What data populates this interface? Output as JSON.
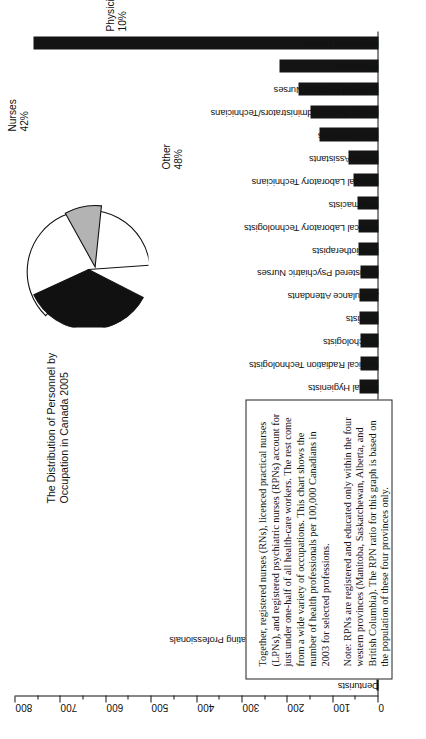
{
  "chart_data": {
    "type": "bar",
    "orientation": "vertical",
    "title": "",
    "xlabel": "",
    "ylabel": "",
    "ylim": [
      0,
      800
    ],
    "ytick_step": 100,
    "yminor_step": 50,
    "grid": false,
    "tick_labels": [
      "0",
      "100",
      "200",
      "300",
      "400",
      "500",
      "600",
      "700",
      "800"
    ],
    "categories": [
      "Denturists",
      "Cardiology Technologists",
      "Other Health Diagnosing and Treating Professionals",
      "Medical Sonographers",
      "Optometrists",
      "Chiropractors",
      "Midwives",
      "Opticians",
      "Dieticians/Nutritionists",
      "Respiratory Therapists",
      "Dental Technicians",
      "Occupational Therapists",
      "Audiologists",
      "Dental Hygienists",
      "Medical Radiation Technologists",
      "Psychologists",
      "Dentists",
      "Ambulance Attendants",
      "Registered Psychiatric Nurses",
      "Physiotherapists",
      "Medical Laboratory Technologists",
      "Pharmacists",
      "Medical Laboratory Technicians",
      "Dental Assistants",
      "Social Workers",
      "Health Record Administrators/Technicians",
      "Licensed Practical Nurses",
      "Physicians",
      "Registered Nurses"
    ],
    "values": [
      4,
      9,
      9,
      14,
      19,
      19,
      15,
      21,
      19,
      26,
      26,
      33,
      31,
      42,
      40,
      40,
      41,
      42,
      40,
      45,
      45,
      46,
      56,
      67,
      131,
      150,
      177,
      218,
      760
    ]
  },
  "pie_chart": {
    "type": "pie",
    "title": "The Distribution of Personnel by Occupation in Canada 2005",
    "slices": [
      {
        "label": "Nurses",
        "percent_label": "42%",
        "value": 42,
        "color": "#111111"
      },
      {
        "label": "Physicians",
        "percent_label": "10%",
        "value": 10,
        "color": "#b3b3b3",
        "exploded": true
      },
      {
        "label": "Other",
        "percent_label": "48%",
        "value": 48,
        "color": "#ffffff"
      }
    ]
  },
  "note_box": {
    "paragraph_1": "Together, registered nurses (RNs), licenced practical nurses (LPNs), and registered psychiatric nurses (RPNs) account for just under one-half of all health-care workers. The rest come from a wide variety of occupations. This chart shows the number of health professionals per 100,000 Canadians in 2003 for selected professions.",
    "paragraph_2": "Note: RPNs are registered and educated only within the four western provinces (Manitoba, Saskatchewan, Alberta, and British Columbia). The RPN ratio for this graph is based on the population of these four provinces only."
  },
  "colors": {
    "bar": "#141414",
    "axis": "#111111",
    "pie_nurses": "#111111",
    "pie_physicians": "#b3b3b3",
    "pie_other": "#ffffff",
    "background": "#ffffff"
  }
}
